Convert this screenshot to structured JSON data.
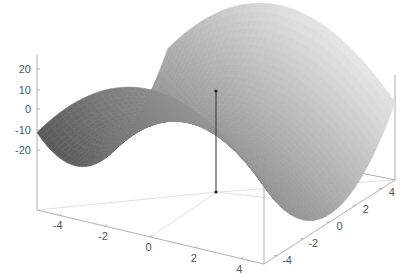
{
  "chart_data": {
    "type": "surface3d",
    "function": "z = x^2 - y^2 (saddle)",
    "title": "",
    "xlabel": "",
    "ylabel": "",
    "zlabel": "",
    "x_range": [
      -5,
      5
    ],
    "y_range": [
      -5,
      5
    ],
    "z_ticks": [
      "20",
      "10",
      "0",
      "-10",
      "-20"
    ],
    "z_tick_values": [
      20,
      10,
      0,
      -10,
      -20
    ],
    "x_ticks": [
      "-4",
      "-2",
      "0",
      "2",
      "4"
    ],
    "x_tick_values": [
      -4,
      -2,
      0,
      2,
      4
    ],
    "y_ticks": [
      "-4",
      "-2",
      "0",
      "2",
      "4"
    ],
    "y_tick_values": [
      -4,
      -2,
      0,
      2,
      4
    ],
    "grid": false,
    "legend": "none",
    "colormap": "grayscale",
    "marker": {
      "label": "stem point at origin",
      "x": 0,
      "y": 0,
      "z_top": 8,
      "z_bottom": -25
    }
  },
  "colors": {
    "surface_light": "#e6e6e6",
    "surface_dark": "#5a5a5a",
    "axis": "#9a9a9a",
    "text": "#555555",
    "marker": "#222222"
  }
}
